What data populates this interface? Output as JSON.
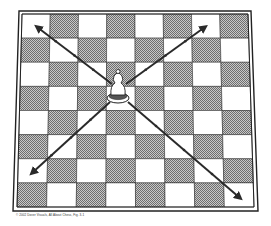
{
  "diagram": {
    "board": {
      "rows": 8,
      "cols": 8,
      "top_left_square": "light",
      "light_color": "#ffffff",
      "dark_color": "#9a9a9a",
      "line_color": "#222222",
      "outer": {
        "tl": [
          19,
          11
        ],
        "tr": [
          251,
          11
        ],
        "bl": [
          13,
          211
        ],
        "br": [
          258,
          211
        ]
      },
      "inner": {
        "tl": [
          22,
          14
        ],
        "tr": [
          248,
          14
        ],
        "bl": [
          17,
          207
        ],
        "br": [
          254,
          207
        ]
      }
    },
    "piece": {
      "type": "bishop",
      "color": "white",
      "square": "d5",
      "center": [
        118,
        88
      ]
    },
    "arrows": [
      {
        "direction": "up-left",
        "from": [
          112,
          84
        ],
        "to": [
          37,
          27
        ]
      },
      {
        "direction": "up-right",
        "from": [
          126,
          84
        ],
        "to": [
          205,
          27
        ]
      },
      {
        "direction": "down-left",
        "from": [
          110,
          102
        ],
        "to": [
          32,
          173
        ]
      },
      {
        "direction": "down-right",
        "from": [
          128,
          102
        ],
        "to": [
          240,
          198
        ]
      }
    ],
    "arrow_color": "#2a2a2a"
  },
  "caption": "© 2002 Dover Visuals, All About Chess, Fig. 3-1"
}
